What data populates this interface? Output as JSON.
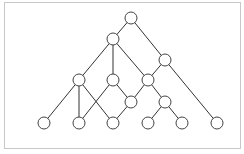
{
  "diagram": {
    "type": "graph",
    "frame": {
      "x": 4,
      "y": 2,
      "width": 236,
      "height": 146,
      "stroke": "#c8c8c8"
    },
    "style": {
      "node_radius": 6,
      "node_fill": "#ffffff",
      "node_stroke": "#444444",
      "edge_stroke": "#333333"
    },
    "nodes": [
      {
        "id": "n0",
        "x": 131,
        "y": 18
      },
      {
        "id": "n1",
        "x": 113,
        "y": 39
      },
      {
        "id": "n2",
        "x": 165,
        "y": 60
      },
      {
        "id": "n3",
        "x": 79,
        "y": 80
      },
      {
        "id": "n4",
        "x": 113,
        "y": 80
      },
      {
        "id": "n5",
        "x": 148,
        "y": 80
      },
      {
        "id": "n6",
        "x": 131,
        "y": 102
      },
      {
        "id": "n7",
        "x": 165,
        "y": 102
      },
      {
        "id": "n8",
        "x": 44,
        "y": 123
      },
      {
        "id": "n9",
        "x": 79,
        "y": 123
      },
      {
        "id": "n10",
        "x": 113,
        "y": 123
      },
      {
        "id": "n11",
        "x": 148,
        "y": 123
      },
      {
        "id": "n12",
        "x": 182,
        "y": 123
      },
      {
        "id": "n13",
        "x": 217,
        "y": 123
      }
    ],
    "edges": [
      [
        "n0",
        "n1"
      ],
      [
        "n0",
        "n2"
      ],
      [
        "n1",
        "n3"
      ],
      [
        "n1",
        "n4"
      ],
      [
        "n1",
        "n5"
      ],
      [
        "n2",
        "n5"
      ],
      [
        "n2",
        "n13"
      ],
      [
        "n3",
        "n8"
      ],
      [
        "n3",
        "n9"
      ],
      [
        "n3",
        "n10"
      ],
      [
        "n4",
        "n9"
      ],
      [
        "n4",
        "n6"
      ],
      [
        "n5",
        "n6"
      ],
      [
        "n5",
        "n7"
      ],
      [
        "n6",
        "n10"
      ],
      [
        "n7",
        "n11"
      ],
      [
        "n7",
        "n12"
      ]
    ]
  }
}
